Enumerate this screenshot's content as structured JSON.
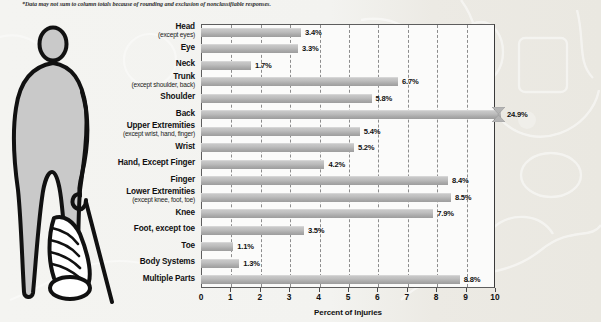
{
  "footnote": "*Data may not sum to column totals because of rounding and exclusion of nonclassifiable responses.",
  "illustration": {
    "name": "injured-person-with-cane",
    "description": "Silhouette of a person with a bandaged leg leaning on a cane"
  },
  "chart_data": {
    "type": "bar",
    "orientation": "horizontal",
    "title": "",
    "xlabel": "Percent of Injuries",
    "ylabel": "",
    "xlim": [
      0,
      10
    ],
    "xticks": [
      "0",
      "1",
      "2",
      "3",
      "4",
      "5",
      "6",
      "7",
      "8",
      "9",
      "10"
    ],
    "grid": true,
    "grid_style": "dashed-vertical",
    "legend": "none",
    "bar_color": "#b4b4b4",
    "categories": [
      "Head",
      "Eye",
      "Neck",
      "Trunk",
      "Shoulder",
      "Back",
      "Upper Extremities",
      "Wrist",
      "Hand, Except Finger",
      "Finger",
      "Lower Extremities",
      "Knee",
      "Foot, except toe",
      "Toe",
      "Body Systems",
      "Multiple Parts"
    ],
    "sublabels": [
      "(except eyes)",
      "",
      "",
      "(except shoulder, back)",
      "",
      "",
      "(except wrist, hand, finger)",
      "",
      "",
      "",
      "(except knee, foot, toe)",
      "",
      "",
      "",
      "",
      ""
    ],
    "values": [
      3.4,
      3.3,
      1.7,
      6.7,
      5.8,
      24.9,
      5.4,
      5.2,
      4.2,
      8.4,
      8.5,
      7.9,
      3.5,
      1.1,
      1.3,
      8.8
    ],
    "value_labels": [
      "3.4%",
      "3.3%",
      "1.7%",
      "6.7%",
      "5.8%",
      "24.9%",
      "5.4%",
      "5.2%",
      "4.2%",
      "8.4%",
      "8.5%",
      "7.9%",
      "3.5%",
      "1.1%",
      "1.3%",
      "8.8%"
    ],
    "clipped_bars": [
      5
    ],
    "clipped_note": "Back bar exceeds the axis maximum and is drawn with an axis-break mark"
  }
}
